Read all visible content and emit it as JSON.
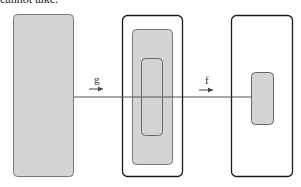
{
  "caption_fragment": "cannot take.",
  "colors": {
    "gray_fill": "#d4d4d4",
    "gray_border": "#777777",
    "black_border": "#1a1a1a",
    "line": "#555555"
  },
  "maps": [
    {
      "label": "g",
      "from": "left-set",
      "to": "middle-set"
    },
    {
      "label": "f",
      "from": "middle-set",
      "to": "right-set"
    }
  ],
  "sets": {
    "left": "domain of g (shaded)",
    "middle": "codomain of g containing image of g and subset",
    "right": "codomain of f with image of f (shaded)"
  }
}
